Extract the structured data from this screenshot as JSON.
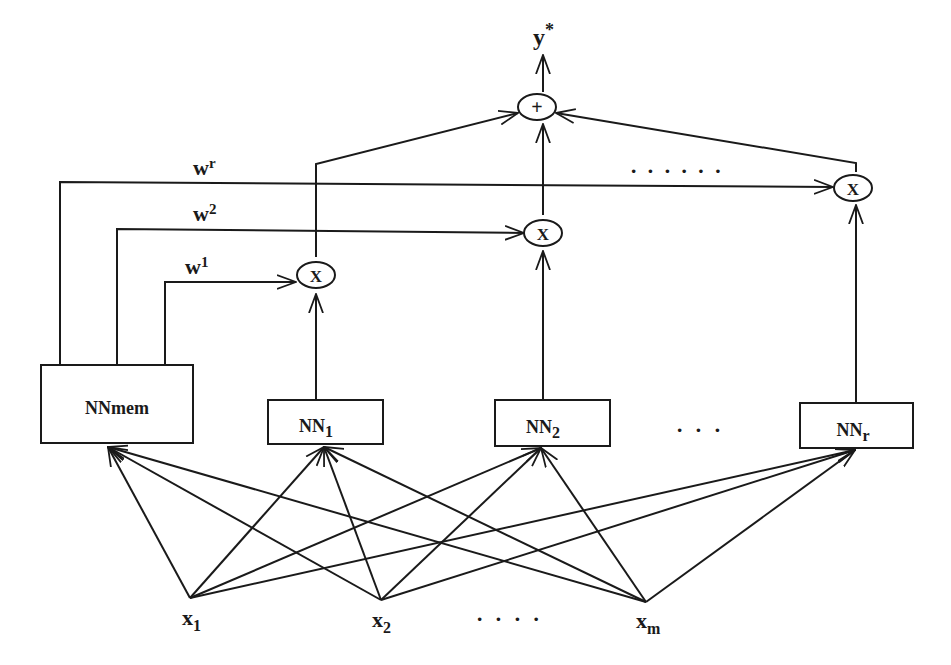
{
  "diagram": {
    "output": {
      "label": "y*",
      "base": "y",
      "sup": "*"
    },
    "sum_node": {
      "label": "+"
    },
    "product_nodes": [
      {
        "id": "mul1",
        "label": "X"
      },
      {
        "id": "mul2",
        "label": "X"
      },
      {
        "id": "mulr",
        "label": "X"
      }
    ],
    "weights": [
      {
        "id": "w1",
        "base": "w",
        "sup": "1"
      },
      {
        "id": "w2",
        "base": "w",
        "sup": "2"
      },
      {
        "id": "wr",
        "base": "w",
        "sup": "r"
      }
    ],
    "networks": [
      {
        "id": "nnmem",
        "base": "NNmem",
        "sub": ""
      },
      {
        "id": "nn1",
        "base": "NN",
        "sub": "1"
      },
      {
        "id": "nn2",
        "base": "NN",
        "sub": "2"
      },
      {
        "id": "nnr",
        "base": "NN",
        "sub": "r"
      }
    ],
    "inputs": [
      {
        "id": "x1",
        "base": "x",
        "sub": "1"
      },
      {
        "id": "x2",
        "base": "x",
        "sub": "2"
      },
      {
        "id": "xm",
        "base": "x",
        "sub": "m"
      }
    ],
    "ellipses": {
      "top": "· · · · · ·",
      "networks": "· · ·",
      "inputs": "· · · ·"
    }
  }
}
